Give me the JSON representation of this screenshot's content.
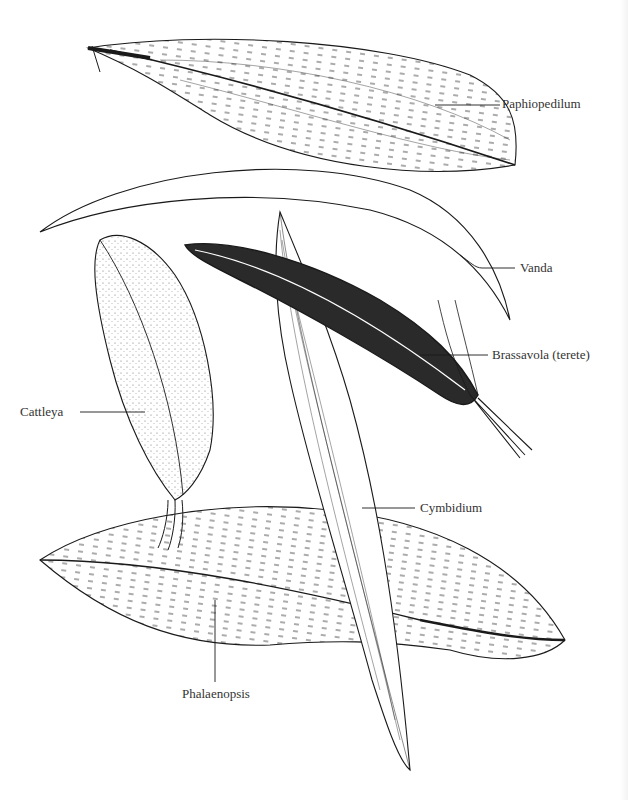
{
  "figure": {
    "type": "botanical-illustration",
    "labels": [
      {
        "id": "paphiopedilum",
        "text": "Paphiopedilum"
      },
      {
        "id": "vanda",
        "text": "Vanda"
      },
      {
        "id": "brassavola",
        "text": "Brassavola (terete)"
      },
      {
        "id": "cattleya",
        "text": "Cattleya"
      },
      {
        "id": "cymbidium",
        "text": "Cymbidium"
      },
      {
        "id": "phalaenopsis",
        "text": "Phalaenopsis"
      }
    ],
    "colors": {
      "ink": "#1a1a1a",
      "paper": "#ffffff",
      "label": "#333333"
    }
  }
}
